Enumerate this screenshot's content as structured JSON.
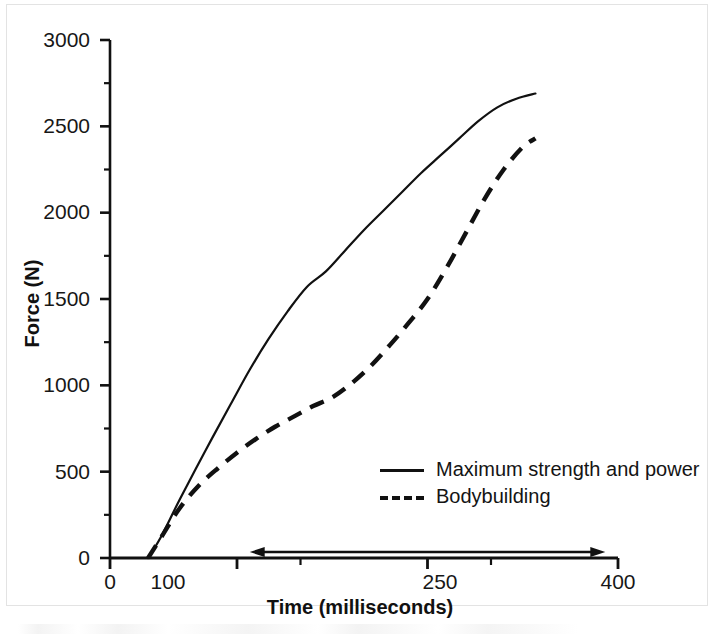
{
  "figure": {
    "background_color": "#ffffff",
    "line_color": "#111111"
  },
  "chart_data": {
    "type": "line",
    "title": "",
    "xlabel": "Time (milliseconds)",
    "ylabel": "Force (N)",
    "xlim": [
      0,
      400
    ],
    "ylim": [
      0,
      3000
    ],
    "grid": false,
    "legend_position": "center-right",
    "x_ticks_major": [
      0,
      100,
      250,
      400
    ],
    "x_tick_labels": [
      "0",
      "100",
      "250",
      "400"
    ],
    "x_ticks_minor": [
      150,
      300
    ],
    "y_ticks_major": [
      0,
      500,
      1000,
      1500,
      2000,
      2500,
      3000
    ],
    "y_tick_labels": [
      "0",
      "500",
      "1000",
      "1500",
      "2000",
      "2500",
      "3000"
    ],
    "y_ticks_minor": [
      250,
      750,
      1250,
      1750,
      2250,
      2750
    ],
    "series": [
      {
        "name": "Maximum strength and power",
        "style": "solid",
        "color": "#111111",
        "x": [
          30,
          40,
          55,
          75,
          95,
          110,
          125,
          140,
          155,
          170,
          185,
          200,
          215,
          230,
          245,
          260,
          275,
          290,
          305,
          320,
          335
        ],
        "y": [
          0,
          120,
          340,
          620,
          890,
          1090,
          1270,
          1430,
          1570,
          1660,
          1780,
          1900,
          2010,
          2120,
          2230,
          2330,
          2430,
          2530,
          2610,
          2660,
          2690
        ]
      },
      {
        "name": "Bodybuilding",
        "style": "dashed",
        "color": "#111111",
        "x": [
          30,
          42,
          55,
          70,
          85,
          100,
          115,
          130,
          145,
          160,
          175,
          190,
          205,
          220,
          235,
          250,
          265,
          280,
          295,
          310,
          325,
          335
        ],
        "y": [
          0,
          140,
          290,
          420,
          520,
          610,
          690,
          760,
          820,
          880,
          930,
          1010,
          1110,
          1230,
          1360,
          1500,
          1680,
          1880,
          2080,
          2250,
          2380,
          2430
        ]
      }
    ],
    "annotations": [
      {
        "name": "time-range-arrow",
        "type": "double-headed-arrow",
        "x_start": 110,
        "x_end": 390,
        "y_position": 0,
        "label": ""
      }
    ]
  },
  "axes": {
    "y_title": "Force (N)",
    "x_title": "Time (milliseconds)"
  },
  "legend": {
    "items": [
      {
        "label": "Maximum strength and power",
        "style": "solid"
      },
      {
        "label": "Bodybuilding",
        "style": "dashed"
      }
    ]
  }
}
